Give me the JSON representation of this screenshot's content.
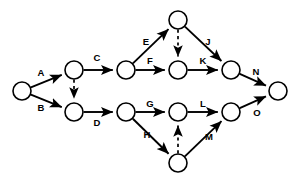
{
  "diagram": {
    "type": "activity-on-arrow-network",
    "canvas": {
      "width": 299,
      "height": 184
    },
    "colors": {
      "background": "#ffffff",
      "stroke": "#000000",
      "node_fill": "#ffffff",
      "label": "#000000"
    },
    "node_radius": 9,
    "nodes": [
      {
        "id": "n1",
        "name": "start-node",
        "x": 22,
        "y": 91
      },
      {
        "id": "n2",
        "name": "node-upper-first",
        "x": 74,
        "y": 70
      },
      {
        "id": "n3",
        "name": "node-lower-first",
        "x": 74,
        "y": 112
      },
      {
        "id": "n4",
        "name": "node-upper-second",
        "x": 126,
        "y": 70
      },
      {
        "id": "n5",
        "name": "node-lower-second",
        "x": 126,
        "y": 112
      },
      {
        "id": "n6",
        "name": "node-top",
        "x": 178,
        "y": 20
      },
      {
        "id": "n7",
        "name": "node-upper-third",
        "x": 178,
        "y": 70
      },
      {
        "id": "n8",
        "name": "node-lower-third",
        "x": 178,
        "y": 112
      },
      {
        "id": "n9",
        "name": "node-bottom",
        "x": 178,
        "y": 163
      },
      {
        "id": "n10",
        "name": "node-upper-merge",
        "x": 231,
        "y": 70
      },
      {
        "id": "n11",
        "name": "node-lower-merge",
        "x": 231,
        "y": 112
      },
      {
        "id": "n12",
        "name": "end-node",
        "x": 278,
        "y": 91
      }
    ],
    "edges": [
      {
        "id": "e-A",
        "label": "A",
        "from": "n1",
        "to": "n2",
        "style": "solid",
        "label_x": 41,
        "label_y": 73
      },
      {
        "id": "e-B",
        "label": "B",
        "from": "n1",
        "to": "n3",
        "style": "solid",
        "label_x": 41,
        "label_y": 108
      },
      {
        "id": "e-C",
        "label": "C",
        "from": "n2",
        "to": "n4",
        "style": "solid",
        "label_x": 97,
        "label_y": 58
      },
      {
        "id": "e-dummy1",
        "label": "",
        "from": "n2",
        "to": "n3",
        "style": "dashed",
        "label_x": 0,
        "label_y": 0
      },
      {
        "id": "e-D",
        "label": "D",
        "from": "n3",
        "to": "n5",
        "style": "solid",
        "label_x": 97,
        "label_y": 123
      },
      {
        "id": "e-E",
        "label": "E",
        "from": "n4",
        "to": "n6",
        "style": "solid",
        "label_x": 146,
        "label_y": 42
      },
      {
        "id": "e-F",
        "label": "F",
        "from": "n4",
        "to": "n7",
        "style": "solid",
        "label_x": 150,
        "label_y": 61
      },
      {
        "id": "e-G",
        "label": "G",
        "from": "n5",
        "to": "n8",
        "style": "solid",
        "label_x": 150,
        "label_y": 104
      },
      {
        "id": "e-H",
        "label": "H",
        "from": "n5",
        "to": "n9",
        "style": "solid",
        "label_x": 147,
        "label_y": 135
      },
      {
        "id": "e-dummy2",
        "label": "",
        "from": "n6",
        "to": "n7",
        "style": "dashed",
        "label_x": 0,
        "label_y": 0
      },
      {
        "id": "e-J",
        "label": "J",
        "from": "n6",
        "to": "n10",
        "style": "solid",
        "label_x": 208,
        "label_y": 42
      },
      {
        "id": "e-K",
        "label": "K",
        "from": "n7",
        "to": "n10",
        "style": "solid",
        "label_x": 203,
        "label_y": 61
      },
      {
        "id": "e-L",
        "label": "L",
        "from": "n8",
        "to": "n11",
        "style": "solid",
        "label_x": 203,
        "label_y": 104
      },
      {
        "id": "e-dummy3",
        "label": "",
        "from": "n9",
        "to": "n8",
        "style": "dashed",
        "label_x": 0,
        "label_y": 0
      },
      {
        "id": "e-M",
        "label": "M",
        "from": "n9",
        "to": "n11",
        "style": "solid",
        "label_x": 209,
        "label_y": 137
      },
      {
        "id": "e-N",
        "label": "N",
        "from": "n10",
        "to": "n12",
        "style": "solid",
        "label_x": 256,
        "label_y": 72
      },
      {
        "id": "e-O",
        "label": "O",
        "from": "n11",
        "to": "n12",
        "style": "solid",
        "label_x": 257,
        "label_y": 113
      }
    ]
  }
}
